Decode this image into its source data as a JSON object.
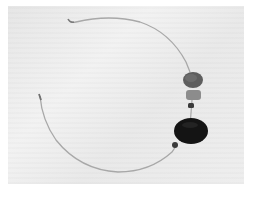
{
  "image": {
    "subject": "Wire necklace with beads and a dark disc pendant",
    "background_color": "#ececec",
    "objects": [
      {
        "name": "wire",
        "color": "#a6a6a6"
      },
      {
        "name": "upper-bead",
        "color": "#5e5e5e"
      },
      {
        "name": "middle-bead",
        "color": "#8a8a8a"
      },
      {
        "name": "small-bead",
        "color": "#3a3a3a"
      },
      {
        "name": "disc-pendant",
        "color": "#141414"
      },
      {
        "name": "lower-small-bead",
        "color": "#3a3a3a"
      }
    ]
  }
}
